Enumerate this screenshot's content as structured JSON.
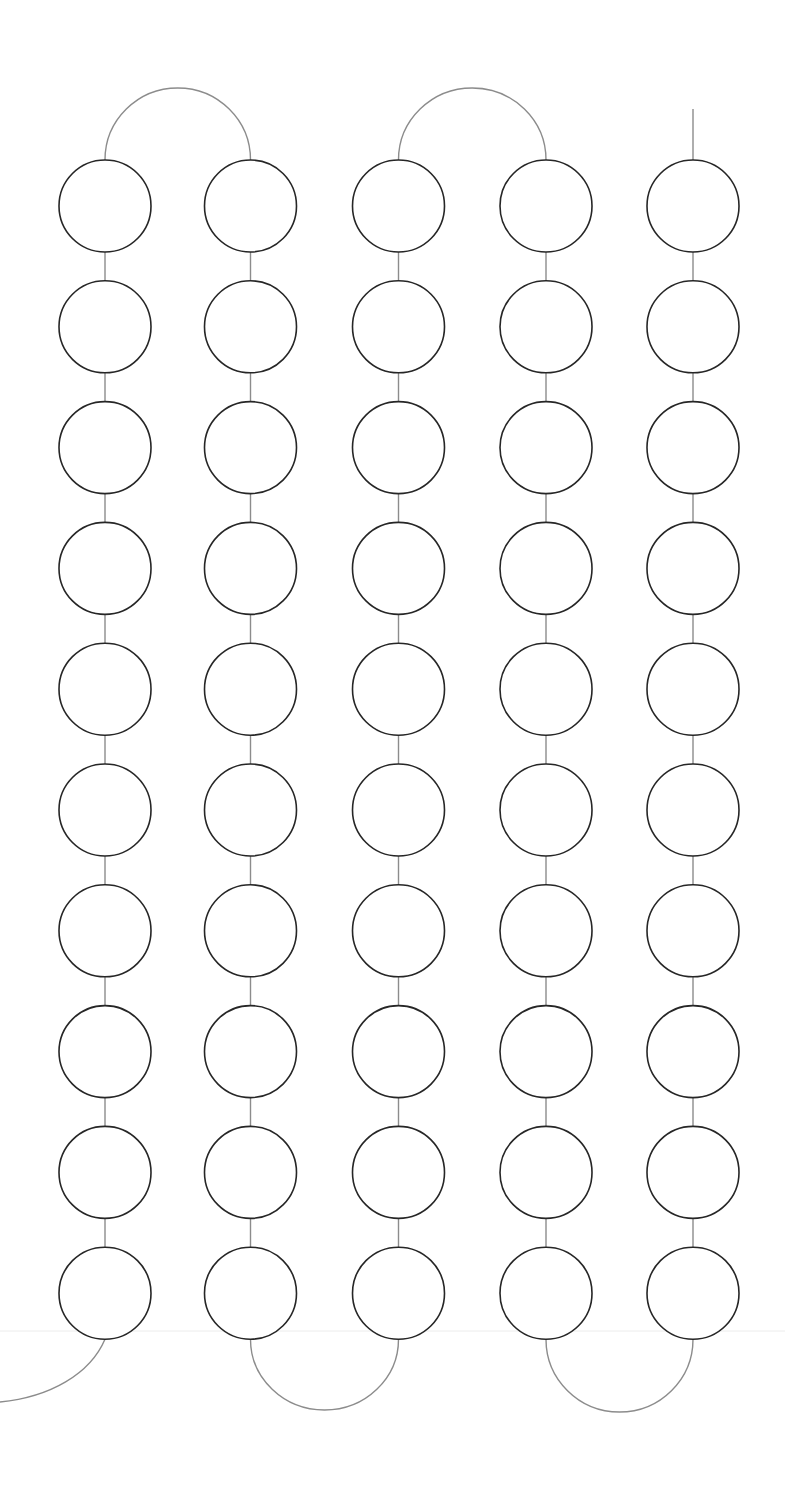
{
  "diagram": {
    "type": "serpentine-chain",
    "width": 785,
    "height": 1494,
    "columns": 5,
    "rows": 10,
    "column_centers_x": [
      105,
      250.5,
      398.5,
      546,
      693
    ],
    "first_row_center_y": 206,
    "row_pitch": 120.8,
    "node_radius": 46,
    "colors": {
      "node_stroke": "#262626",
      "node_fill": "#ffffff",
      "connector": "#8c8c8c",
      "baseline": "#ececec",
      "background": "#ffffff"
    },
    "top_arcs": [
      {
        "from_col": 0,
        "to_col": 1,
        "peak_y": 88
      },
      {
        "from_col": 2,
        "to_col": 3,
        "peak_y": 88
      }
    ],
    "bottom_arcs": [
      {
        "from_col": 1,
        "to_col": 2,
        "trough_y": 1410
      },
      {
        "from_col": 3,
        "to_col": 4,
        "trough_y": 1412
      }
    ],
    "top_lead": {
      "col": 4,
      "start_y": 109
    },
    "bottom_lead": {
      "col": 0,
      "end_x": 0,
      "end_y": 1402
    },
    "baseline_y": 1331
  }
}
